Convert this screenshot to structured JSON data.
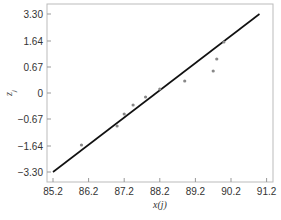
{
  "chart_data": {
    "type": "scatter",
    "title": "",
    "xlabel": "x(j)",
    "ylabel": "z_j",
    "xlim": [
      85.2,
      91.2
    ],
    "ylim": [
      -3.3,
      3.3
    ],
    "x_ticks": [
      "85.2",
      "86.2",
      "87.2",
      "88.2",
      "89.2",
      "90.2",
      "91.2"
    ],
    "y_ticks": [
      "3.30",
      "1.64",
      "0.67",
      "0",
      "-0.67",
      "-1.64",
      "-3.30"
    ],
    "grid": false,
    "legend": null,
    "series": [
      {
        "name": "observations",
        "marker": "dot",
        "x": [
          86.0,
          87.0,
          87.2,
          87.45,
          87.8,
          88.2,
          88.9,
          89.7,
          89.8,
          90.0
        ],
        "y_px": [
          145,
          126,
          114,
          105,
          97,
          89,
          81,
          71,
          59,
          42
        ]
      },
      {
        "name": "fitted line",
        "type": "line",
        "x": [
          85.2,
          91.0
        ],
        "y_px": [
          172,
          14
        ]
      }
    ],
    "colors": {
      "points": "#888888",
      "line": "#111111",
      "axis": "#999999",
      "text": "#333333"
    }
  }
}
